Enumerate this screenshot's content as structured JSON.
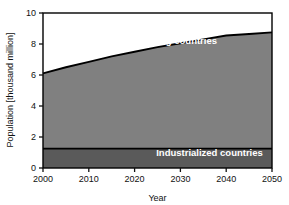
{
  "chart_data": {
    "type": "area",
    "title": "",
    "subtitle": "",
    "xlabel": "Year",
    "ylabel": "Population [thousand million]",
    "xlim": [
      2000,
      2050
    ],
    "ylim": [
      0,
      10
    ],
    "xticks": [
      2000,
      2010,
      2020,
      2030,
      2040,
      2050
    ],
    "xtick_labels": [
      "2000",
      "2010",
      "2020",
      "2030",
      "2040",
      "2050"
    ],
    "yticks": [
      0,
      2,
      4,
      6,
      8,
      10
    ],
    "ytick_labels": [
      "0",
      "2",
      "4",
      "6",
      "8",
      "10"
    ],
    "grid": false,
    "legend_position": "inline-annotations",
    "stacked": true,
    "x": [
      2000,
      2005,
      2010,
      2015,
      2020,
      2025,
      2030,
      2035,
      2040,
      2045,
      2050
    ],
    "series": [
      {
        "name": "Industrialized countries",
        "color": "#5a5a5a",
        "values": [
          1.25,
          1.25,
          1.25,
          1.25,
          1.25,
          1.25,
          1.25,
          1.25,
          1.25,
          1.25,
          1.25
        ]
      },
      {
        "name": "Developing countries",
        "color": "#808080",
        "values": [
          4.85,
          5.25,
          5.6,
          5.95,
          6.25,
          6.55,
          6.8,
          7.05,
          7.3,
          7.4,
          7.5
        ]
      }
    ],
    "total_line": {
      "name": "Total population",
      "color": "#000000",
      "values": [
        6.1,
        6.5,
        6.85,
        7.2,
        7.5,
        7.8,
        8.05,
        8.3,
        8.55,
        8.65,
        8.75
      ]
    },
    "annotations": [
      {
        "text": "Developing countries",
        "x": 2038,
        "y": 8.0,
        "color": "#ffffff",
        "anchor": "end"
      },
      {
        "text": "Industrialized countries",
        "x": 2048,
        "y": 0.75,
        "color": "#ffffff",
        "anchor": "end"
      }
    ]
  },
  "figure": {
    "background": "#ffffff",
    "frame_color": "#000000",
    "tick_color": "#111111"
  }
}
